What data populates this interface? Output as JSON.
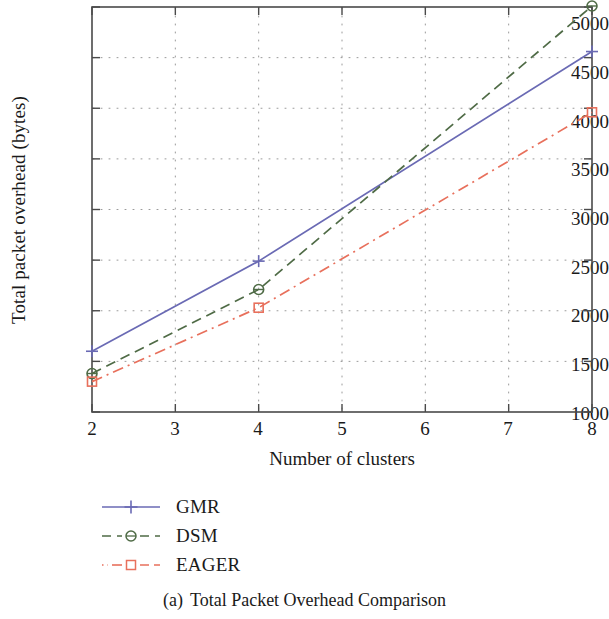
{
  "chart_data": {
    "type": "line",
    "title": "",
    "xlabel": "Number of clusters",
    "ylabel": "Total packet overhead (bytes)",
    "x": [
      2,
      4,
      8
    ],
    "xlim": [
      2,
      8
    ],
    "ylim": [
      1000,
      5000
    ],
    "xticks": [
      "2",
      "3",
      "4",
      "5",
      "6",
      "7",
      "8"
    ],
    "yticks": [
      "1000",
      "1500",
      "2000",
      "2500",
      "3000",
      "3500",
      "4000",
      "4500",
      "5000"
    ],
    "grid": true,
    "grid_style": "dotted",
    "legend_position": "below-left",
    "series": [
      {
        "name": "GMR",
        "values": [
          1600,
          2490,
          4560
        ],
        "color": "#6a6ab4",
        "line_style": "solid",
        "marker": "plus"
      },
      {
        "name": "DSM",
        "values": [
          1380,
          2210,
          5010
        ],
        "color": "#4f6b46",
        "line_style": "dashed",
        "marker": "circle"
      },
      {
        "name": "EAGER",
        "values": [
          1300,
          2030,
          3960
        ],
        "color": "#e8705c",
        "line_style": "dashdot",
        "marker": "square"
      }
    ]
  },
  "legend": {
    "items": [
      {
        "label": "GMR"
      },
      {
        "label": "DSM"
      },
      {
        "label": "EAGER"
      }
    ]
  },
  "caption": {
    "index": "(a)",
    "text": "Total Packet Overhead Comparison"
  },
  "colors": {
    "axis": "#4a4a4a",
    "grid": "#8a8a8a",
    "text": "#1a1a1a",
    "background": "#ffffff"
  }
}
